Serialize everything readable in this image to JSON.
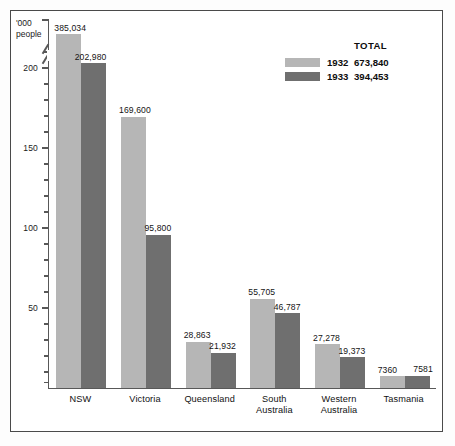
{
  "chart_data": {
    "type": "bar",
    "title": "",
    "subtitle": "",
    "xlabel": "",
    "ylabel": "'000 people",
    "ylabel_line1": "'000",
    "ylabel_line2": "people",
    "categories": [
      "NSW",
      "Victoria",
      "Queensland",
      "South Australia",
      "Western Australia",
      "Tasmania"
    ],
    "category_lines": [
      [
        "NSW"
      ],
      [
        "Victoria"
      ],
      [
        "Queensland"
      ],
      [
        "South",
        "Australia"
      ],
      [
        "Western",
        "Australia"
      ],
      [
        "Tasmania"
      ]
    ],
    "series": [
      {
        "name": "1932",
        "color": "#b6b6b6",
        "total": "673,840",
        "values": [
          385034,
          169600,
          28863,
          55705,
          27278,
          7360
        ],
        "labels": [
          "385,034",
          "169,600",
          "28,863",
          "55,705",
          "27,278",
          "7360"
        ]
      },
      {
        "name": "1933",
        "color": "#6f6f6f",
        "total": "394,453",
        "values": [
          202980,
          95800,
          21932,
          46787,
          19373,
          7581
        ],
        "labels": [
          "202,980",
          "95,800",
          "21,932",
          "46,787",
          "19,373",
          "7581"
        ]
      }
    ],
    "ylim": [
      0,
      230
    ],
    "y_axis_broken": true,
    "y_ticks_major": [
      50,
      100,
      150,
      200
    ],
    "y_tick_labels": [
      "50",
      "100",
      "150",
      "200"
    ],
    "y_ticks_minor": [
      10,
      20,
      30,
      40,
      60,
      70,
      80,
      90,
      110,
      120,
      130,
      140,
      160,
      170,
      180,
      190,
      210,
      220
    ],
    "grid": false,
    "legend_position": "top-right",
    "units_note": "values shown in persons; axis in '000 people"
  },
  "legend": {
    "total_header": "TOTAL",
    "rows": [
      {
        "year": "1932",
        "total": "673,840",
        "color": "#b6b6b6"
      },
      {
        "year": "1933",
        "total": "394,453",
        "color": "#6f6f6f"
      }
    ]
  }
}
